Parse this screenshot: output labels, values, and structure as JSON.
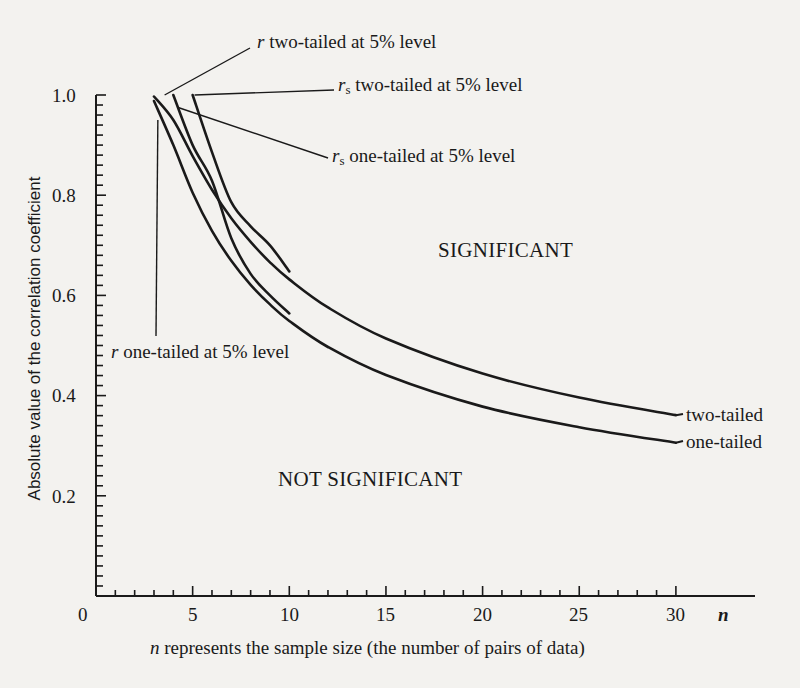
{
  "chart_data": {
    "type": "line",
    "title": "",
    "xlabel": "n represents the sample size (the number of pairs of data)",
    "xlabel_var": "n",
    "xlabel_rest": " represents the sample size (the number of pairs of data)",
    "ylabel": "Absolute value of the correlation coefficient",
    "xlim": [
      0,
      31
    ],
    "ylim": [
      0,
      1.0
    ],
    "x_ticks": [
      "0",
      "5",
      "10",
      "15",
      "20",
      "25",
      "30"
    ],
    "x_tick_values": [
      0,
      5,
      10,
      15,
      20,
      25,
      30
    ],
    "x_axis_end_label": "n",
    "y_ticks": [
      "0.2",
      "0.4",
      "0.6",
      "0.8",
      "1.0"
    ],
    "y_tick_values": [
      0.2,
      0.4,
      0.6,
      0.8,
      1.0
    ],
    "grid": false,
    "legend_position": "inline annotations",
    "series": [
      {
        "name": "r two-tailed at 5% level",
        "label_var": "r",
        "label_sub": "",
        "label_rest": " two-tailed at 5% level",
        "short_label": "two-tailed",
        "x": [
          3,
          4,
          5,
          6,
          7,
          8,
          9,
          10,
          12,
          15,
          20,
          25,
          30
        ],
        "y": [
          0.997,
          0.95,
          0.878,
          0.811,
          0.754,
          0.707,
          0.666,
          0.632,
          0.576,
          0.514,
          0.444,
          0.396,
          0.361
        ]
      },
      {
        "name": "r one-tailed at 5% level",
        "label_var": "r",
        "label_sub": "",
        "label_rest": " one-tailed at 5% level",
        "short_label": "one-tailed",
        "x": [
          3,
          4,
          5,
          6,
          7,
          8,
          9,
          10,
          12,
          15,
          20,
          25,
          30
        ],
        "y": [
          0.988,
          0.9,
          0.805,
          0.729,
          0.669,
          0.621,
          0.582,
          0.549,
          0.497,
          0.441,
          0.378,
          0.337,
          0.306
        ]
      },
      {
        "name": "rs two-tailed at 5% level",
        "label_var": "r",
        "label_sub": "s",
        "label_rest": " two-tailed at 5% level",
        "x": [
          5,
          6,
          7,
          8,
          9,
          10
        ],
        "y": [
          1.0,
          0.886,
          0.786,
          0.738,
          0.7,
          0.648
        ]
      },
      {
        "name": "rs one-tailed at 5% level",
        "label_var": "r",
        "label_sub": "s",
        "label_rest": " one-tailed at 5% level",
        "x": [
          4,
          5,
          6,
          7,
          8,
          9,
          10
        ],
        "y": [
          1.0,
          0.9,
          0.829,
          0.714,
          0.643,
          0.6,
          0.564
        ]
      }
    ],
    "annotations": {
      "significant": "SIGNIFICANT",
      "not_significant": "NOT SIGNIFICANT",
      "end_two_tailed": "two-tailed",
      "end_one_tailed": "one-tailed"
    }
  },
  "colors": {
    "background": "#f3f2ef",
    "ink": "#1a1a1a"
  }
}
